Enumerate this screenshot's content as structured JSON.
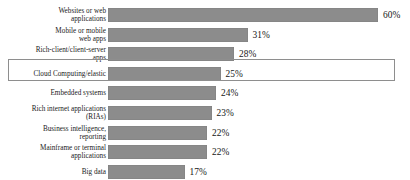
{
  "chart_data": {
    "type": "bar",
    "orientation": "horizontal",
    "title": "",
    "subtitle": "",
    "xlabel": "",
    "ylabel": "",
    "xlim": [
      0,
      60
    ],
    "grid": false,
    "legend": null,
    "value_suffix": "%",
    "bar_color": "#8c8c8c",
    "highlight_color": "#8e8e8e",
    "highlighted_category": "Cloud Computing/elastic",
    "categories": [
      "Websites or web applications",
      "Mobile or mobile web apps",
      "Rich-client/client-server apps",
      "Cloud Computing/elastic",
      "Embedded systems",
      "Rich internet applications (RIAs)",
      "Business intelligence, reporting",
      "Mainframe or terminal applications",
      "Big data"
    ],
    "values": [
      60,
      31,
      28,
      25,
      24,
      23,
      22,
      22,
      17
    ],
    "value_labels": [
      "60%",
      "31%",
      "28%",
      "25%",
      "24%",
      "23%",
      "22%",
      "22%",
      "17%"
    ]
  },
  "rows": [
    {
      "label": "Websites or web\napplications",
      "value": 60,
      "value_label": "60%",
      "highlighted": false
    },
    {
      "label": "Mobile or mobile\nweb apps",
      "value": 31,
      "value_label": "31%",
      "highlighted": false
    },
    {
      "label": "Rich-client/client-server\napps",
      "value": 28,
      "value_label": "28%",
      "highlighted": false
    },
    {
      "label": "Cloud Computing/elastic",
      "value": 25,
      "value_label": "25%",
      "highlighted": true
    },
    {
      "label": "Embedded systems",
      "value": 24,
      "value_label": "24%",
      "highlighted": false
    },
    {
      "label": "Rich internet applications\n(RIAs)",
      "value": 23,
      "value_label": "23%",
      "highlighted": false
    },
    {
      "label": "Business intelligence,\nreporting",
      "value": 22,
      "value_label": "22%",
      "highlighted": false
    },
    {
      "label": "Mainframe or terminal\napplications",
      "value": 22,
      "value_label": "22%",
      "highlighted": false
    },
    {
      "label": "Big data",
      "value": 17,
      "value_label": "17%",
      "highlighted": false
    }
  ]
}
